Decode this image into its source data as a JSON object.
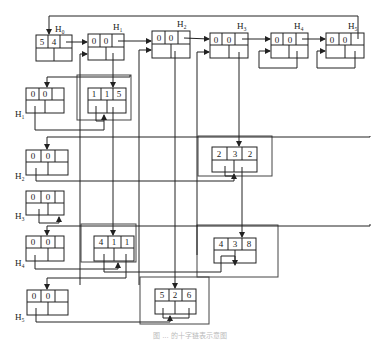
{
  "diagram": {
    "type": "orthogonal-list (cross-linked sparse matrix)",
    "row_heads": {
      "H0": {
        "label": "H₀",
        "values": [
          "5",
          "4"
        ]
      },
      "H1": {
        "label": "H₁",
        "values": [
          "0",
          "0"
        ]
      },
      "H2": {
        "label": "H₂",
        "values": [
          "0",
          "0"
        ]
      },
      "H3": {
        "label": "H₃",
        "values": [
          "0",
          "0"
        ]
      },
      "H4": {
        "label": "H₄",
        "values": [
          "0",
          "0"
        ]
      },
      "H5": {
        "label": "H₅",
        "values": [
          "0",
          "0"
        ]
      }
    },
    "column_heads": {
      "H1": {
        "label": "H₁",
        "values": [
          "0",
          "0"
        ]
      },
      "H2": {
        "label": "H₂",
        "values": [
          "0",
          "0"
        ]
      },
      "H3": {
        "label": "H₃",
        "values": [
          "0",
          "0"
        ]
      },
      "H4": {
        "label": "H₄",
        "values": [
          "0",
          "0"
        ]
      },
      "H5": {
        "label": "H₅",
        "values": [
          "0",
          "0"
        ]
      }
    },
    "nodes": [
      {
        "row": "1",
        "col": "1",
        "val": "5"
      },
      {
        "row": "2",
        "col": "3",
        "val": "2"
      },
      {
        "row": "4",
        "col": "1",
        "val": "1"
      },
      {
        "row": "4",
        "col": "3",
        "val": "8"
      },
      {
        "row": "5",
        "col": "2",
        "val": "6"
      }
    ],
    "caption": "图 ... 的十字链表示意图"
  }
}
